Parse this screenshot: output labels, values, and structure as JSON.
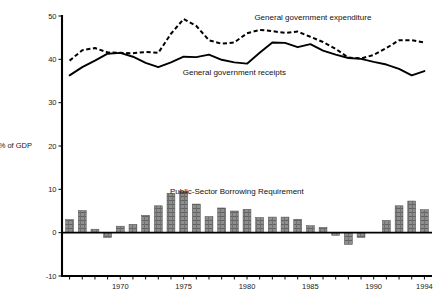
{
  "chart_data": {
    "type": "line",
    "title": "",
    "subtitle": "",
    "xlabel": "",
    "ylabel": "% of GDP",
    "ylim": [
      -10,
      50
    ],
    "xlim": [
      1965.4,
      1994.6
    ],
    "grid": false,
    "legend_position": "inline-annotations",
    "yticks": [
      "50",
      "40",
      "30",
      "20",
      "10",
      "0",
      "-10"
    ],
    "ytick_values": [
      50,
      40,
      30,
      20,
      10,
      0,
      -10
    ],
    "xticks": [
      "1970",
      "1975",
      "1980",
      "1985",
      "1990",
      "1994"
    ],
    "xtick_values": [
      1970,
      1975,
      1980,
      1985,
      1990,
      1994
    ],
    "x": [
      1966,
      1967,
      1968,
      1969,
      1970,
      1971,
      1972,
      1973,
      1974,
      1975,
      1976,
      1977,
      1978,
      1979,
      1980,
      1981,
      1982,
      1983,
      1984,
      1985,
      1986,
      1987,
      1988,
      1989,
      1990,
      1991,
      1992,
      1993,
      1994
    ],
    "series": [
      {
        "name": "General government expenditure",
        "style": "dashed-line",
        "values": [
          39.7,
          42.1,
          42.6,
          41.6,
          41.5,
          41.4,
          41.7,
          41.5,
          45.9,
          49.3,
          47.7,
          44.4,
          43.6,
          43.9,
          46.0,
          46.8,
          46.5,
          46.1,
          46.4,
          45.2,
          44.0,
          42.4,
          40.4,
          40.2,
          41.0,
          42.6,
          44.4,
          44.4,
          43.9
        ]
      },
      {
        "name": "General government receipts",
        "style": "solid-line",
        "values": [
          36.3,
          38.2,
          39.7,
          41.3,
          41.5,
          40.6,
          39.2,
          38.2,
          39.3,
          40.6,
          40.5,
          41.1,
          39.9,
          39.3,
          39.0,
          41.5,
          43.9,
          43.8,
          42.8,
          43.5,
          42.0,
          41.1,
          40.3,
          40.1,
          39.4,
          38.8,
          37.8,
          36.3,
          37.3
        ]
      },
      {
        "name": "Public-Sector Borrowing Requirement",
        "style": "hatched-bars",
        "values": [
          3.0,
          5.1,
          0.8,
          -1.1,
          1.5,
          1.9,
          4.0,
          6.2,
          9.1,
          9.5,
          6.6,
          3.7,
          5.7,
          5.0,
          5.4,
          3.5,
          3.6,
          3.6,
          3.1,
          1.6,
          1.2,
          -0.6,
          -2.7,
          -1.1,
          0.0,
          2.8,
          6.2,
          7.3,
          5.3
        ]
      }
    ],
    "annotations": [
      {
        "text": "General government expenditure",
        "x": 1985.2,
        "y": 49.0
      },
      {
        "text": "General government receipts",
        "x": 1979.0,
        "y": 36.3
      },
      {
        "text": "Public-Sector Borrowing Requirement",
        "x": 1979.2,
        "y": 9.0
      }
    ],
    "colors": {
      "line": "#000000",
      "bar_fill": "#8e8e8e",
      "bar_edge": "#4a4a4a",
      "axis": "#000000",
      "text": "#111111",
      "background": "#ffffff"
    }
  },
  "axis": {
    "y_title": "% of GDP"
  }
}
